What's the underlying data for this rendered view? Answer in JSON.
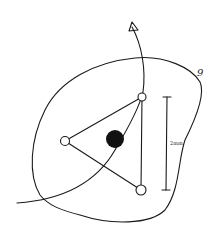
{
  "diagram": {
    "outline_label": "9",
    "scale_bar_label": "2mm",
    "nodes": [
      {
        "name": "top-right-node",
        "type": "open-circle"
      },
      {
        "name": "left-node",
        "type": "open-circle"
      },
      {
        "name": "bottom-right-node",
        "type": "open-circle"
      },
      {
        "name": "center-dot",
        "type": "filled-circle"
      }
    ],
    "ink_color": "#1a1a1a",
    "background_color": "#ffffff"
  }
}
